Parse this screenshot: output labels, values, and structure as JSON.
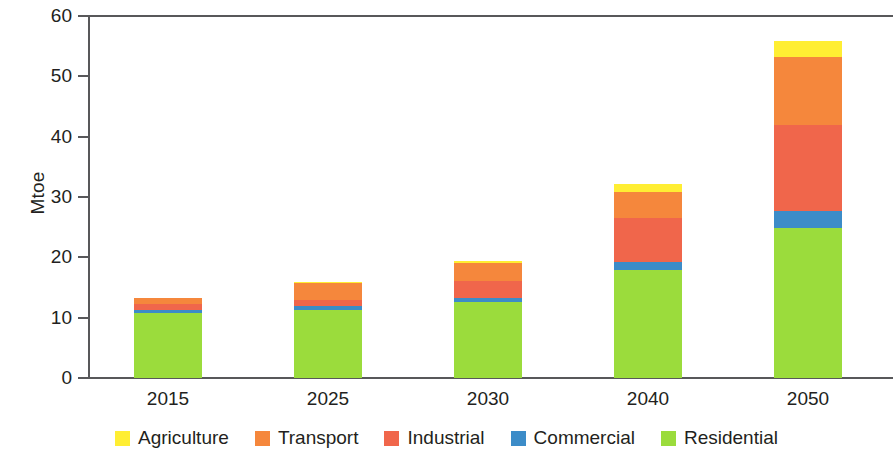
{
  "chart_data": {
    "type": "bar",
    "stacked": true,
    "title": "",
    "xlabel": "",
    "ylabel": "Mtoe",
    "ylim": [
      0,
      60
    ],
    "yticks": [
      0,
      10,
      20,
      30,
      40,
      50,
      60
    ],
    "grid": false,
    "legend_position": "bottom",
    "categories": [
      "2015",
      "2025",
      "2030",
      "2040",
      "2050"
    ],
    "series": [
      {
        "name": "Residential",
        "color": "#9BDC3C",
        "values": [
          10.8,
          11.3,
          12.6,
          17.9,
          24.9
        ]
      },
      {
        "name": "Commercial",
        "color": "#3C8CC8",
        "values": [
          0.4,
          0.7,
          0.7,
          1.3,
          2.8
        ]
      },
      {
        "name": "Industrial",
        "color": "#F0664B",
        "values": [
          1.0,
          1.0,
          2.8,
          7.3,
          14.3
        ]
      },
      {
        "name": "Transport",
        "color": "#F5873C",
        "values": [
          1.0,
          2.7,
          3.0,
          4.4,
          11.2
        ]
      },
      {
        "name": "Agriculture",
        "color": "#FFEE33",
        "values": [
          0.1,
          0.3,
          0.3,
          1.3,
          2.6
        ]
      }
    ],
    "totals": [
      13.3,
      16.0,
      19.4,
      32.2,
      55.8
    ],
    "annotations": []
  },
  "axis": {
    "y_title": "Mtoe",
    "y_tick_labels": [
      "0",
      "10",
      "20",
      "30",
      "40",
      "50",
      "60"
    ],
    "x_tick_labels": [
      "2015",
      "2025",
      "2030",
      "2040",
      "2050"
    ]
  },
  "legend": {
    "items": [
      {
        "label": "Agriculture",
        "color": "#FFEE33"
      },
      {
        "label": "Transport",
        "color": "#F5873C"
      },
      {
        "label": "Industrial",
        "color": "#F0664B"
      },
      {
        "label": "Commercial",
        "color": "#3C8CC8"
      },
      {
        "label": "Residential",
        "color": "#9BDC3C"
      }
    ]
  },
  "colors": {
    "axis": "#58585a",
    "text": "#231f20",
    "background": "#ffffff"
  }
}
